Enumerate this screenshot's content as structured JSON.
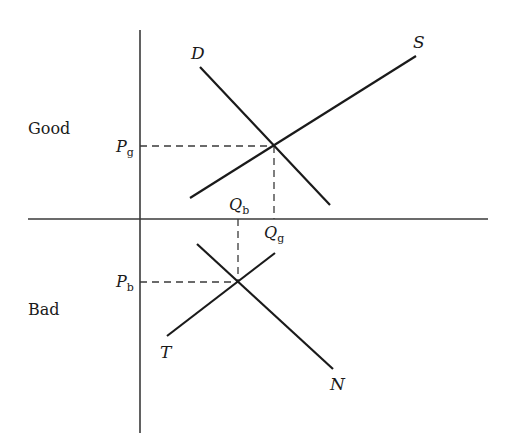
{
  "diagram": {
    "type": "supply-demand-two-markets",
    "market_labels": {
      "good": "Good",
      "bad": "Bad"
    },
    "curves": {
      "demand_good": {
        "label": "D",
        "from": [
          200,
          67
        ],
        "to": [
          330,
          205
        ]
      },
      "supply_good": {
        "label": "S",
        "from": [
          190,
          198
        ],
        "to": [
          416,
          56
        ]
      },
      "supply_bad": {
        "label": "T",
        "from": [
          167,
          336
        ],
        "to": [
          275,
          253
        ]
      },
      "demand_bad": {
        "label": "N",
        "from": [
          197,
          244
        ],
        "to": [
          333,
          369
        ]
      }
    },
    "equilibria": {
      "good": {
        "price_label": "P",
        "price_sub": "g",
        "qty_label": "Q",
        "qty_sub": "g",
        "point": [
          274,
          146
        ]
      },
      "bad": {
        "price_label": "P",
        "price_sub": "b",
        "qty_label": "Q",
        "qty_sub": "b",
        "point": [
          238,
          282
        ]
      }
    },
    "axes": {
      "vertical": {
        "x": 140,
        "y1": 30,
        "y2": 433
      },
      "horizontal": {
        "y": 219,
        "x1": 28,
        "x2": 488
      }
    },
    "colors": {
      "line": "#1a1a1a",
      "axis": "#3a3a3a",
      "background": "#ffffff"
    }
  }
}
